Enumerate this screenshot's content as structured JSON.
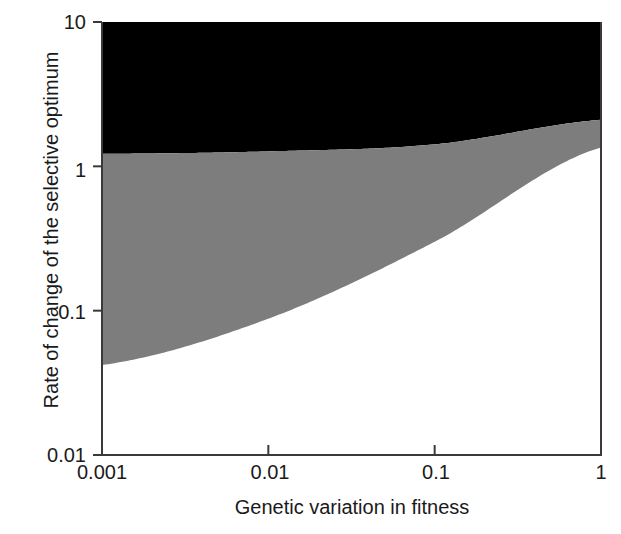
{
  "chart_data": {
    "type": "area",
    "title": "",
    "xlabel": "Genetic variation in fitness",
    "ylabel": "Rate of change of the selective optimum",
    "xscale": "log",
    "yscale": "log",
    "xlim": [
      0.001,
      1
    ],
    "ylim": [
      0.01,
      10
    ],
    "grid": false,
    "legend": "none",
    "xticks": [
      {
        "value": 0.001,
        "label": "0.001"
      },
      {
        "value": 0.01,
        "label": "0.01"
      },
      {
        "value": 0.1,
        "label": "0.1"
      },
      {
        "value": 1,
        "label": "1"
      }
    ],
    "yticks": [
      {
        "value": 10,
        "label": "10"
      },
      {
        "value": 1,
        "label": "1"
      },
      {
        "value": 0.1,
        "label": "0.1"
      },
      {
        "value": 0.01,
        "label": "0.01"
      }
    ],
    "x": [
      0.001,
      0.01,
      0.1,
      1
    ],
    "series": [
      {
        "name": "upper-boundary",
        "role": "black-gray boundary",
        "values": [
          1.22,
          1.27,
          1.42,
          2.1
        ]
      },
      {
        "name": "lower-boundary",
        "role": "gray-white boundary",
        "values": [
          0.042,
          0.088,
          0.3,
          1.35
        ]
      }
    ],
    "regions": [
      {
        "name": "black-region",
        "color": "#000000",
        "description": "region above the upper boundary up to y = 10"
      },
      {
        "name": "gray-region",
        "color": "#7d7d7d",
        "description": "region between the lower and upper boundaries"
      },
      {
        "name": "white-region",
        "color": "#ffffff",
        "description": "region below the lower boundary down to y = 0.01"
      }
    ]
  },
  "colors": {
    "black_region": "#000000",
    "gray_region": "#7d7d7d",
    "white_region": "#ffffff",
    "axis": "#3a3a3a",
    "text": "#1a1a1a"
  }
}
